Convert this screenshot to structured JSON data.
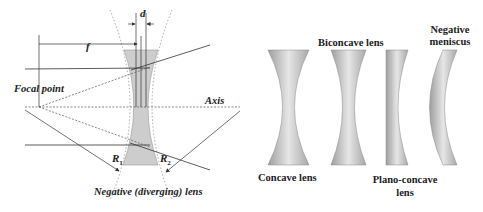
{
  "left_diagram": {
    "title": "Negative (diverging) lens",
    "labels": {
      "d": "d",
      "f": "f",
      "focal_point": "Focal point",
      "axis": "Axis",
      "r1": "R",
      "r1_sub": "1",
      "r2": "R",
      "r2_sub": "2"
    }
  },
  "right_diagram": {
    "lenses": [
      {
        "name": "Concave lens",
        "label": "Concave lens"
      },
      {
        "name": "Biconcave lens",
        "label": "Biconcave lens"
      },
      {
        "name": "Plano-concave lens",
        "label_line1": "Plano-concave",
        "label_line2": "lens"
      },
      {
        "name": "Negative meniscus",
        "label_line1": "Negative",
        "label_line2": "meniscus"
      }
    ]
  },
  "colors": {
    "lens_fill": "#cfcfcf",
    "line": "#333333",
    "background": "#ffffff"
  }
}
